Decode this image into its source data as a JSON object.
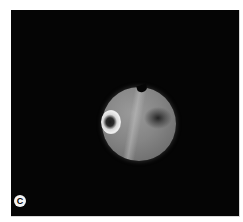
{
  "figure": {
    "panel_label": "C",
    "image_type": "fundus photograph",
    "colors": {
      "background": "#050505",
      "page": "#ffffff",
      "fundus": "#858585",
      "optic_disc": "#f0f0f0",
      "macula_dark": "#1e1e1e"
    }
  }
}
